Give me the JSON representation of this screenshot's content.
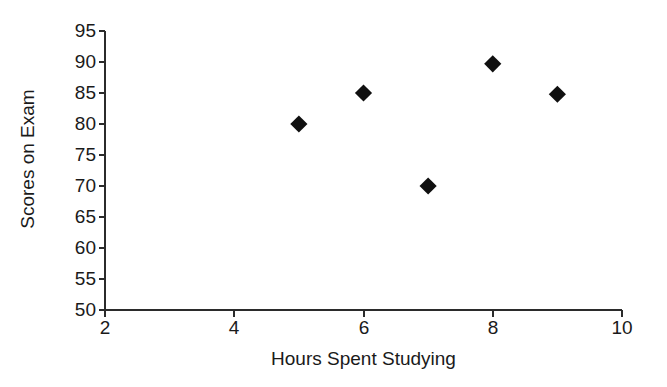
{
  "chart_data": {
    "type": "scatter",
    "title": "",
    "xlabel": "Hours Spent Studying",
    "ylabel": "Scores on Exam",
    "xlim": [
      2,
      10
    ],
    "ylim": [
      50,
      95
    ],
    "xticks": [
      2,
      4,
      6,
      8,
      10
    ],
    "yticks": [
      50,
      55,
      60,
      65,
      70,
      75,
      80,
      85,
      90,
      95
    ],
    "xtick_labels": [
      "2",
      "4",
      "6",
      "8",
      "10"
    ],
    "ytick_labels": [
      "50",
      "55",
      "60",
      "65",
      "70",
      "75",
      "80",
      "85",
      "90",
      "95"
    ],
    "grid": false,
    "legend": false,
    "marker_shape": "diamond",
    "marker_color": "#101010",
    "axis_color": "#2b2b2b",
    "background_color": "#ffffff",
    "series": [
      {
        "name": "Exam scores",
        "points": [
          {
            "x": 5,
            "y": 80
          },
          {
            "x": 6,
            "y": 85
          },
          {
            "x": 7,
            "y": 70
          },
          {
            "x": 8,
            "y": 89.7
          },
          {
            "x": 9,
            "y": 84.8
          }
        ]
      }
    ]
  }
}
